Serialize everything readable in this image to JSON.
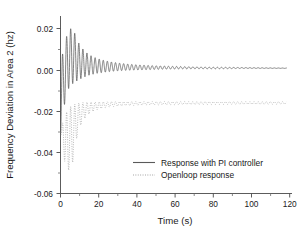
{
  "chart_data": {
    "type": "line",
    "title": "",
    "xlabel": "Time (s)",
    "ylabel": "Frequency Deviation in Area 2 (hz)",
    "xlim": [
      0,
      125
    ],
    "ylim": [
      -0.06,
      0.025
    ],
    "xticks": [
      0,
      20,
      40,
      60,
      80,
      100,
      120
    ],
    "xtick_labels": [
      "0",
      "20",
      "40",
      "60",
      "80",
      "100",
      "120"
    ],
    "yticks": [
      0.02,
      0.0,
      -0.02,
      -0.04,
      -0.06
    ],
    "ytick_labels": [
      "0.02",
      "0.00",
      "-0.02",
      "-0.04",
      "-0.06"
    ],
    "grid": false,
    "legend_position": "lower-center-right",
    "minor_ticks": true,
    "series": [
      {
        "name": "Response with PI controller",
        "style": "solid",
        "color": "#5a5a5a",
        "settling_value": 0.0,
        "peak_value": 0.019,
        "peak_time": 6.6,
        "initial_dip": -0.0315,
        "oscillation_period": 2.2,
        "decay_time_constant": 26,
        "notes": "Damped oscillation rising from an initial negative transient, overshooting to +0.019 near t=6.6 s, then decaying to zero by about t=110 s",
        "x": [
          0,
          0.4,
          0.9,
          1.4,
          1.9,
          2.4,
          2.9,
          3.4,
          4.0,
          4.6,
          5.2,
          5.8,
          6.6,
          7.4,
          8.2,
          9.0,
          9.8,
          10.6,
          11.5,
          12.5,
          14,
          16,
          18,
          20,
          24,
          28,
          32,
          36,
          40,
          50,
          60,
          70,
          80,
          90,
          100,
          110,
          120
        ],
        "envelope_upper": [
          0.002,
          0.004,
          0.006,
          0.008,
          0.01,
          0.012,
          0.014,
          0.0155,
          0.017,
          0.018,
          0.0188,
          0.019,
          0.019,
          0.0175,
          0.0155,
          0.0138,
          0.0122,
          0.011,
          0.0098,
          0.0088,
          0.0075,
          0.0062,
          0.0053,
          0.0046,
          0.0036,
          0.0029,
          0.0024,
          0.002,
          0.0017,
          0.0012,
          0.0009,
          0.0007,
          0.0005,
          0.0004,
          0.0003,
          0.0002,
          0.0001
        ],
        "envelope_lower": [
          -0.0315,
          -0.03,
          -0.027,
          -0.023,
          -0.019,
          -0.016,
          -0.0135,
          -0.0118,
          -0.0104,
          -0.0094,
          -0.0086,
          -0.008,
          -0.0074,
          -0.0069,
          -0.0064,
          -0.006,
          -0.0056,
          -0.0052,
          -0.0048,
          -0.0044,
          -0.0038,
          -0.0032,
          -0.0028,
          -0.0024,
          -0.0019,
          -0.0015,
          -0.0012,
          -0.001,
          -0.0009,
          -0.0006,
          -0.0004,
          -0.0003,
          -0.0003,
          -0.0002,
          -0.0001,
          -0.0001,
          -0.0001
        ]
      },
      {
        "name": "Openloop response",
        "style": "dotted",
        "color": "#9a9a9a",
        "settling_value": -0.017,
        "min_value": -0.049,
        "min_time": 8.5,
        "initial_dip": -0.03,
        "oscillation_period": 2.2,
        "decay_time_constant": 12,
        "notes": "Damped oscillation about a non-zero steady-state offset of -0.017, with a deep negative excursion reaching -0.049 near t=8.5 s",
        "x": [
          0,
          0.5,
          1.0,
          1.6,
          2.2,
          2.8,
          3.4,
          4.0,
          4.8,
          5.6,
          6.4,
          7.2,
          8.0,
          8.8,
          9.6,
          10.5,
          11.5,
          12.5,
          14,
          16,
          18,
          20,
          24,
          28,
          32,
          36,
          40,
          50,
          60,
          70,
          80,
          90,
          100,
          110,
          120
        ],
        "envelope_upper": [
          -0.0285,
          -0.0275,
          -0.0265,
          -0.025,
          -0.0235,
          -0.022,
          -0.0208,
          -0.0198,
          -0.0188,
          -0.0182,
          -0.0177,
          -0.0174,
          -0.0171,
          -0.0169,
          -0.0167,
          -0.0166,
          -0.0165,
          -0.0164,
          -0.0163,
          -0.0162,
          -0.0162,
          -0.0161,
          -0.0161,
          -0.016,
          -0.016,
          -0.016,
          -0.016,
          -0.016,
          -0.016,
          -0.016,
          -0.016,
          -0.016,
          -0.016,
          -0.016,
          -0.016
        ],
        "envelope_lower": [
          -0.0305,
          -0.034,
          -0.038,
          -0.0415,
          -0.0445,
          -0.0465,
          -0.0478,
          -0.0486,
          -0.049,
          -0.0482,
          -0.046,
          -0.042,
          -0.0375,
          -0.0335,
          -0.0305,
          -0.0282,
          -0.0262,
          -0.0248,
          -0.023,
          -0.0215,
          -0.0205,
          -0.0198,
          -0.0189,
          -0.0184,
          -0.0181,
          -0.0179,
          -0.0178,
          -0.0176,
          -0.0175,
          -0.0174,
          -0.0174,
          -0.0173,
          -0.0173,
          -0.0173,
          -0.0172
        ]
      }
    ]
  },
  "legend": {
    "entries": [
      {
        "label": "Response with PI controller",
        "style": "solid"
      },
      {
        "label": "Openloop response",
        "style": "dotted"
      }
    ]
  }
}
